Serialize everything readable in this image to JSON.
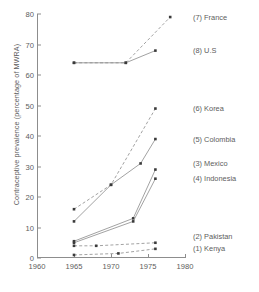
{
  "chart_data": {
    "type": "line",
    "title": "",
    "xlabel": "",
    "ylabel": "Contraceptive prevalence (percentage of MWRA)",
    "xlim": [
      1960,
      1980
    ],
    "ylim": [
      0,
      80
    ],
    "xticks": [
      1960,
      1965,
      1970,
      1975,
      1980
    ],
    "yticks": [
      0,
      10,
      20,
      30,
      40,
      50,
      60,
      70,
      80
    ],
    "grid": false,
    "legend_position": "right-inline",
    "marker": "square",
    "series": [
      {
        "name": "(1) Kenya",
        "key": "kenya",
        "number": 1,
        "style": "dashed",
        "label_y_value": 3,
        "points": [
          {
            "x": 1965,
            "y": 1
          },
          {
            "x": 1971,
            "y": 1.5
          },
          {
            "x": 1976,
            "y": 3
          }
        ]
      },
      {
        "name": "(2) Pakistan",
        "key": "pakistan",
        "number": 2,
        "style": "dashed",
        "label_y_value": 7,
        "points": [
          {
            "x": 1965,
            "y": 4
          },
          {
            "x": 1968,
            "y": 4
          },
          {
            "x": 1976,
            "y": 5
          }
        ]
      },
      {
        "name": "(3) Mexico",
        "key": "mexico",
        "number": 3,
        "style": "solid",
        "label_y_value": 31,
        "points": [
          {
            "x": 1965,
            "y": 5.5
          },
          {
            "x": 1973,
            "y": 13
          },
          {
            "x": 1976,
            "y": 29
          }
        ]
      },
      {
        "name": "(4) Indonesia",
        "key": "indonesia",
        "number": 4,
        "style": "solid",
        "label_y_value": 26,
        "points": [
          {
            "x": 1965,
            "y": 5
          },
          {
            "x": 1973,
            "y": 12
          },
          {
            "x": 1976,
            "y": 26
          }
        ]
      },
      {
        "name": "(5) Colombia",
        "key": "colombia",
        "number": 5,
        "style": "solid",
        "label_y_value": 39,
        "points": [
          {
            "x": 1965,
            "y": 12
          },
          {
            "x": 1970,
            "y": 24
          },
          {
            "x": 1974,
            "y": 31
          },
          {
            "x": 1976,
            "y": 39
          }
        ]
      },
      {
        "name": "(6) Korea",
        "key": "korea",
        "number": 6,
        "style": "dashed",
        "label_y_value": 49,
        "points": [
          {
            "x": 1965,
            "y": 16
          },
          {
            "x": 1970,
            "y": 24
          },
          {
            "x": 1976,
            "y": 49
          }
        ]
      },
      {
        "name": "(7) France",
        "key": "france",
        "number": 7,
        "style": "dashed",
        "label_y_value": 79,
        "points": [
          {
            "x": 1965,
            "y": 64
          },
          {
            "x": 1972,
            "y": 64
          },
          {
            "x": 1978,
            "y": 79
          }
        ]
      },
      {
        "name": "(8) U.S",
        "key": "us",
        "number": 8,
        "style": "solid",
        "label_y_value": 68,
        "points": [
          {
            "x": 1965,
            "y": 64
          },
          {
            "x": 1972,
            "y": 64
          },
          {
            "x": 1976,
            "y": 68
          }
        ]
      }
    ]
  },
  "axes": {
    "y_title": "Contraceptive prevalence (percentage of MWRA)",
    "y_tick_labels": [
      "0",
      "10",
      "20",
      "30",
      "40",
      "50",
      "60",
      "70",
      "80"
    ],
    "x_tick_labels": [
      "1960",
      "1965",
      "1970",
      "1975",
      "1980"
    ]
  },
  "series_labels": [
    "(7) France",
    "(8) U.S",
    "(6) Korea",
    "(5) Colombia",
    "(3) Mexico",
    "(4) Indonesia",
    "(2) Pakistan",
    "(1) Kenya"
  ],
  "colors": {
    "axis": "#8d8d8d",
    "text": "#5d5d5d",
    "line": "#8a8a8a",
    "marker": "#3a3a3a",
    "background": "#ffffff"
  }
}
